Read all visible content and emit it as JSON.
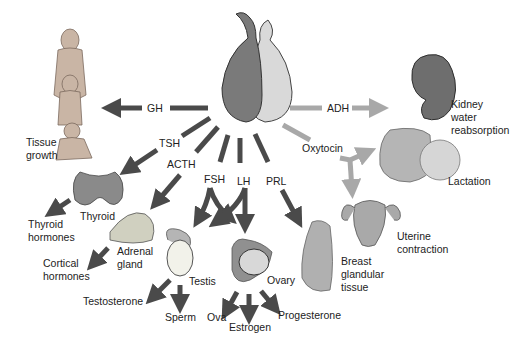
{
  "center": {
    "name": "pituitary-gland",
    "anterior_color": "#7a7a7a",
    "posterior_color": "#d9d9d9"
  },
  "colors": {
    "anterior_arrow": "#4a4a4a",
    "posterior_arrow": "#a8a8a8",
    "text": "#222222"
  },
  "hormones": {
    "gh": "GH",
    "tsh": "TSH",
    "acth": "ACTH",
    "fsh": "FSH",
    "lh": "LH",
    "prl": "PRL",
    "adh": "ADH",
    "oxytocin": "Oxytocin"
  },
  "targets": {
    "tissue_growth": "Tissue\ngrowth",
    "thyroid": "Thyroid",
    "thyroid_hormones": "Thyroid\nhormones",
    "adrenal_gland": "Adrenal\ngland",
    "cortical_hormones": "Cortical\nhormones",
    "testis": "Testis",
    "testosterone": "Testosterone",
    "sperm": "Sperm",
    "ovary": "Ovary",
    "ova": "Ova",
    "estrogen": "Estrogen",
    "progesterone": "Progesterone",
    "breast": "Breast\nglandular\ntissue",
    "kidney": "Kidney\nwater\nreabsorption",
    "lactation": "Lactation",
    "uterine": "Uterine\ncontraction"
  }
}
